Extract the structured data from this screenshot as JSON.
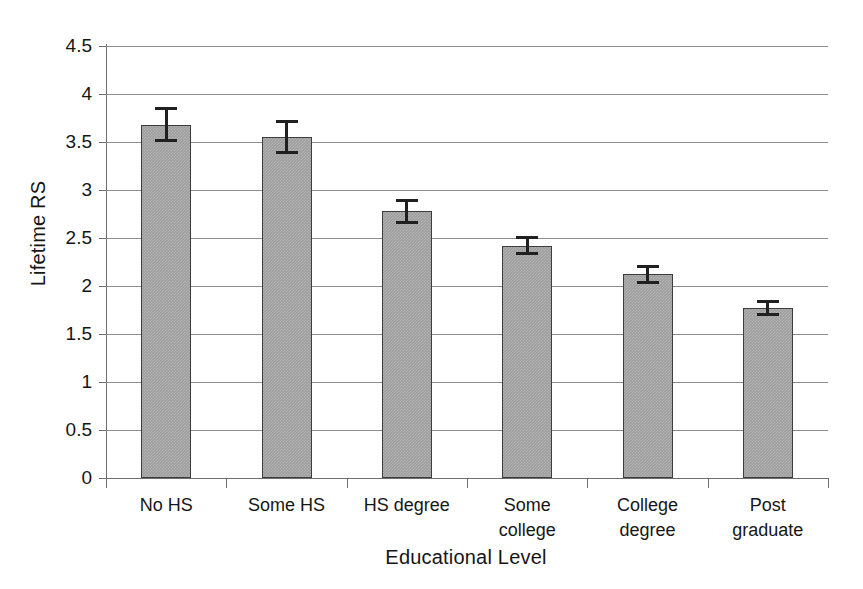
{
  "chart_data": {
    "type": "bar",
    "title": "",
    "xlabel": "Educational Level",
    "ylabel": "Lifetime RS",
    "categories": [
      "No HS",
      "Some HS",
      "HS degree",
      "Some college",
      "College degree",
      "Post graduate"
    ],
    "category_lines": [
      [
        "No HS"
      ],
      [
        "Some HS"
      ],
      [
        "HS degree"
      ],
      [
        "Some",
        "college"
      ],
      [
        "College",
        "degree"
      ],
      [
        "Post",
        "graduate"
      ]
    ],
    "values": [
      3.68,
      3.55,
      2.78,
      2.42,
      2.12,
      1.77
    ],
    "errors": [
      0.18,
      0.18,
      0.13,
      0.1,
      0.1,
      0.08
    ],
    "error_type": "symmetric",
    "ylim": [
      0,
      4.5
    ],
    "ytick_labels": [
      "4.5",
      "4",
      "3.5",
      "3",
      "2.5",
      "2",
      "1.5",
      "1",
      "0.5",
      "0"
    ],
    "ytick_values": [
      4.5,
      4,
      3.5,
      3,
      2.5,
      2,
      1.5,
      1,
      0.5,
      0
    ],
    "grid": "horizontal",
    "legend": "none",
    "bar_fill_color": "#9d9d9d",
    "bar_border_color": "#3d3d3d",
    "gridline_color": "#8c8c8c",
    "axis_color": "#6e6e6e",
    "error_bar_color": "#202020",
    "background_color": "#ffffff"
  }
}
